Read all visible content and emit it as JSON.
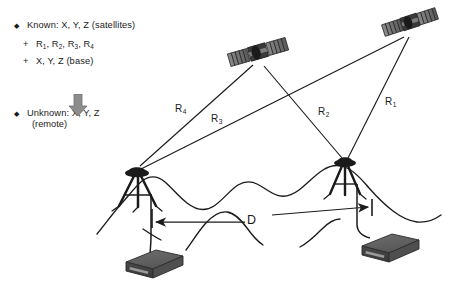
{
  "figure": {
    "background_color": "#ffffff",
    "ink_color": "#1b1b1b"
  },
  "legend": {
    "known": {
      "bullet": "diamond-bullet",
      "label": "Known: X, Y, Z (satellites)"
    },
    "plus_ranges": {
      "sign": "+",
      "prefix": "R",
      "subscripts": [
        "1",
        "2",
        "3",
        "4"
      ],
      "label": "R1, R2, R3, R4"
    },
    "plus_base": {
      "sign": "+",
      "label": "X, Y, Z (base)"
    },
    "arrow": {
      "icon": "down-arrow-icon",
      "direction": "down"
    },
    "unknown": {
      "bullet": "diamond-bullet",
      "label": "Unknown: X, Y, Z",
      "sub_label": "(remote)"
    }
  },
  "diagram": {
    "satellites": [
      {
        "name": "satellite-left",
        "x": 258,
        "y": 52
      },
      {
        "name": "satellite-right",
        "x": 410,
        "y": 22
      }
    ],
    "antennas": [
      {
        "name": "antenna-base-left",
        "x": 137,
        "y": 172
      },
      {
        "name": "antenna-remote-right",
        "x": 344,
        "y": 162
      }
    ],
    "receivers": [
      {
        "name": "receiver-left",
        "x": 150,
        "y": 262
      },
      {
        "name": "receiver-right",
        "x": 388,
        "y": 244
      }
    ],
    "range_labels": [
      {
        "id": "R1",
        "prefix": "R",
        "subscript": "1",
        "from": "satellite-right",
        "to": "antenna-remote-right"
      },
      {
        "id": "R2",
        "prefix": "R",
        "subscript": "2",
        "from": "satellite-left",
        "to": "antenna-remote-right"
      },
      {
        "id": "R3",
        "prefix": "R",
        "subscript": "3",
        "from": "satellite-right",
        "to": "antenna-base-left"
      },
      {
        "id": "R4",
        "prefix": "R",
        "subscript": "4",
        "from": "satellite-left",
        "to": "antenna-base-left"
      }
    ],
    "baseline": {
      "label": "D",
      "name": "baseline-distance",
      "arrow_style": "double-headed"
    },
    "terrain": {
      "name": "terrain-outline",
      "style": "hand-drawn hill profile"
    }
  }
}
